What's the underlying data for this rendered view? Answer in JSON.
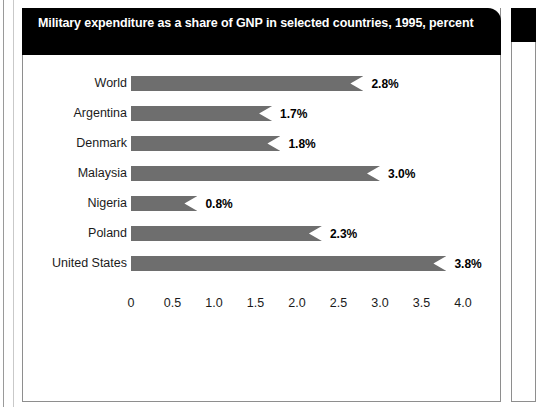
{
  "figure": {
    "title": "Military expenditure as a share of GNP in selected countries, 1995, percent"
  },
  "chart_data": {
    "type": "bar",
    "orientation": "horizontal",
    "title": "Military expenditure as a share of GNP in selected countries, 1995, percent",
    "xlabel": "",
    "ylabel": "",
    "categories": [
      "World",
      "Argentina",
      "Denmark",
      "Malaysia",
      "Nigeria",
      "Poland",
      "United States"
    ],
    "values": [
      2.8,
      1.7,
      1.8,
      3.0,
      0.8,
      2.3,
      3.8
    ],
    "data_labels": [
      "2.8%",
      "1.7%",
      "1.8%",
      "3.0%",
      "0.8%",
      "2.3%",
      "3.8%"
    ],
    "xlim": [
      0,
      4.0
    ],
    "xticks": [
      0,
      0.5,
      1.0,
      1.5,
      2.0,
      2.5,
      3.0,
      3.5,
      4.0
    ],
    "xtick_labels": [
      "0",
      "0.5",
      "1.0",
      "1.5",
      "2.0",
      "2.5",
      "3.0",
      "3.5",
      "4.0"
    ],
    "grid": false,
    "legend": null,
    "bar_color": "#6e6e6e",
    "title_background": "#000000",
    "title_color": "#ffffff"
  }
}
